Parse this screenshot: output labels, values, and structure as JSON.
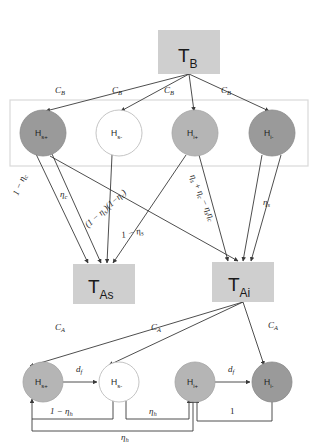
{
  "diagram": {
    "type": "node-graph",
    "colors": {
      "node_dark": "#9a9a9a",
      "node_mid": "#b5b5b5",
      "node_light": "#ffffff",
      "tbox": "#cfcfcf",
      "edge": "#3a3a3a",
      "frame": "#d9d9d9",
      "background": "#ffffff"
    },
    "t_nodes": [
      {
        "id": "TB",
        "base": "T",
        "sub": "B",
        "x": 158,
        "y": 30,
        "w": 62,
        "h": 44
      },
      {
        "id": "TAs",
        "base": "T",
        "sub": "As",
        "x": 73,
        "y": 264,
        "w": 62,
        "h": 40
      },
      {
        "id": "TAi",
        "base": "T",
        "sub": "Ai",
        "x": 212,
        "y": 262,
        "w": 62,
        "h": 40
      }
    ],
    "top_nodes": [
      {
        "id": "Hs+",
        "base": "H",
        "sub": "s+",
        "x": 43,
        "y": 133,
        "r": 23,
        "fill": "dark"
      },
      {
        "id": "Hs-",
        "base": "H",
        "sub": "s-",
        "x": 119,
        "y": 133,
        "r": 23,
        "fill": "light"
      },
      {
        "id": "Hi+",
        "base": "H",
        "sub": "i+",
        "x": 195,
        "y": 133,
        "r": 23,
        "fill": "mid"
      },
      {
        "id": "Hi-",
        "base": "H",
        "sub": "i-",
        "x": 272,
        "y": 133,
        "r": 23,
        "fill": "dark"
      }
    ],
    "bottom_nodes": [
      {
        "id": "bHs+",
        "base": "H",
        "sub": "s+",
        "x": 43,
        "y": 382,
        "r": 20,
        "fill": "mid"
      },
      {
        "id": "bHs-",
        "base": "H",
        "sub": "s-",
        "x": 119,
        "y": 382,
        "r": 20,
        "fill": "light"
      },
      {
        "id": "bHi+",
        "base": "H",
        "sub": "i+",
        "x": 195,
        "y": 382,
        "r": 20,
        "fill": "mid"
      },
      {
        "id": "bHi-",
        "base": "H",
        "sub": "i-",
        "x": 272,
        "y": 382,
        "r": 20,
        "fill": "dark"
      }
    ],
    "frame": {
      "x": 10,
      "y": 100,
      "w": 298,
      "h": 66
    },
    "edge_labels": [
      {
        "id": "cb1",
        "base": "C",
        "sub": "B",
        "x": 62,
        "y": 90,
        "rot": 0
      },
      {
        "id": "cb2",
        "base": "C",
        "sub": "B",
        "x": 119,
        "y": 90,
        "rot": 0
      },
      {
        "id": "cb3",
        "base": "C",
        "sub": "B",
        "x": 171,
        "y": 90,
        "rot": 0
      },
      {
        "id": "cb4",
        "base": "C",
        "sub": "B",
        "x": 228,
        "y": 90,
        "rot": 0
      },
      {
        "id": "eta_c",
        "text": "η",
        "sub": "c",
        "x": 66,
        "y": 194,
        "rot": 0
      },
      {
        "id": "one_minus_etac",
        "text": "1 − η",
        "sub": "c",
        "x": 24,
        "y": 196,
        "rot": -68
      },
      {
        "id": "prod",
        "text": "(1 − η",
        "sub": "s",
        "text2": ")(1−η",
        "sub2": "c",
        "text3": ")",
        "x": 104,
        "y": 218,
        "rot": -41
      },
      {
        "id": "one_minus_etas",
        "text": "1 − η",
        "sub": "s",
        "x": 138,
        "y": 232,
        "rot": -13
      },
      {
        "id": "sum",
        "text": "η",
        "sub": "s",
        "text2": " + η",
        "sub2": "c",
        "text3": " − η",
        "sub3": "s",
        "text4": "η",
        "sub4": "c",
        "x": 196,
        "y": 196,
        "rot": 65
      },
      {
        "id": "eta_s",
        "text": "η",
        "sub": "s",
        "x": 268,
        "y": 202,
        "rot": 0
      },
      {
        "id": "ca1",
        "base": "C",
        "sub": "A",
        "x": 62,
        "y": 327,
        "rot": 0
      },
      {
        "id": "ca2",
        "base": "C",
        "sub": "A",
        "x": 158,
        "y": 327,
        "rot": 0
      },
      {
        "id": "ca3",
        "base": "C",
        "sub": "A",
        "x": 275,
        "y": 325,
        "rot": 0
      },
      {
        "id": "df1",
        "text": "d",
        "sub": "f",
        "x": 81,
        "y": 360,
        "rot": 0
      },
      {
        "id": "df2",
        "text": "d",
        "sub": "f",
        "x": 233,
        "y": 360,
        "rot": 0
      },
      {
        "id": "one_minus_etah",
        "text": "1 − η",
        "sub": "h",
        "x": 66,
        "y": 409,
        "rot": 0
      },
      {
        "id": "eta_h1",
        "text": "η",
        "sub": "h",
        "x": 155,
        "y": 409,
        "rot": 0
      },
      {
        "id": "one",
        "text": "1",
        "sub": "",
        "x": 233,
        "y": 409,
        "rot": 0
      },
      {
        "id": "eta_h2",
        "text": "η",
        "sub": "h",
        "x": 127,
        "y": 436,
        "rot": 0
      }
    ]
  }
}
